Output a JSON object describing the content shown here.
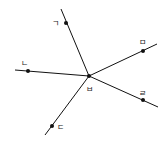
{
  "diagram": {
    "center": {
      "label": "ㅂ"
    },
    "points": [
      {
        "id": "giyeok",
        "label": "ㄱ"
      },
      {
        "id": "mieum",
        "label": "ㅁ"
      },
      {
        "id": "nieun",
        "label": "ㄴ"
      },
      {
        "id": "rieul",
        "label": "ㄹ"
      },
      {
        "id": "digeut",
        "label": "ㄷ"
      }
    ],
    "colors": {
      "line": "#111111",
      "text": "#222222"
    }
  }
}
